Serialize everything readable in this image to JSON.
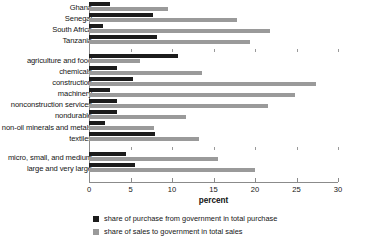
{
  "chart_data": {
    "type": "bar",
    "orientation": "horizontal",
    "title": "",
    "xlabel": "percent",
    "ylabel": "",
    "xlim": [
      0,
      30
    ],
    "xticks": [
      0,
      5,
      10,
      15,
      20,
      25,
      30
    ],
    "xtick_labels": [
      "0",
      "5",
      "10",
      "15",
      "20",
      "25",
      "30"
    ],
    "grid": false,
    "legend_position": "bottom",
    "series": [
      {
        "name": "share of purchase from government in total purchase",
        "color": "#1c1c1c",
        "values": [
          2.5,
          7.7,
          1.7,
          8.2,
          10.7,
          3.4,
          5.3,
          2.5,
          3.4,
          3.4,
          1.9,
          7.9,
          4.5,
          5.5
        ]
      },
      {
        "name": "share of sales to government in total sales",
        "color": "#9a9a9a",
        "values": [
          9.5,
          17.8,
          21.8,
          19.4,
          6.1,
          13.6,
          27.4,
          24.8,
          21.6,
          11.7,
          7.8,
          13.3,
          15.6,
          20.0
        ]
      }
    ],
    "categories": [
      "Ghana",
      "Senegal",
      "South Africa",
      "Tanzania",
      "agriculture and food",
      "chemicals",
      "construction",
      "machinery",
      "nonconstruction services",
      "nondurable",
      "non-oil minerals and metals",
      "textiles",
      "micro, small, and medium",
      "large and very large"
    ],
    "group_breaks_after": [
      3,
      11
    ]
  },
  "legend": {
    "items": [
      {
        "label": "share of purchase from government in total purchase",
        "swatch": "dark"
      },
      {
        "label": "share of sales to government in total sales",
        "swatch": "light"
      }
    ]
  },
  "axis": {
    "title": "percent"
  }
}
